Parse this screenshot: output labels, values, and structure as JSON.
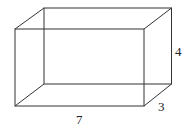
{
  "diagram": {
    "type": "rectangular-prism-wireframe",
    "dimensions": {
      "length": "7",
      "height": "4",
      "depth": "3"
    },
    "colors": {
      "edge": "#333333",
      "text": "#222222",
      "background": "#ffffff"
    }
  }
}
